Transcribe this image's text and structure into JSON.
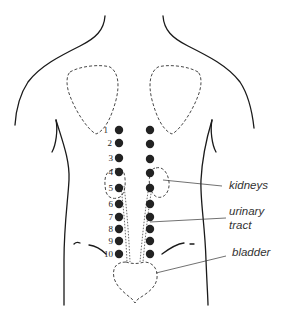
{
  "diagram": {
    "point_numbers": [
      "1",
      "2",
      "3",
      "4",
      "5",
      "6",
      "7",
      "8",
      "9",
      "10"
    ],
    "labels": {
      "kidneys": "kidneys",
      "urinary_tract_line1": "urinary",
      "urinary_tract_line2": "tract",
      "bladder": "bladder"
    },
    "colors": {
      "outline": "#1a1a1a",
      "dots": "#222222",
      "background": "#ffffff"
    }
  }
}
